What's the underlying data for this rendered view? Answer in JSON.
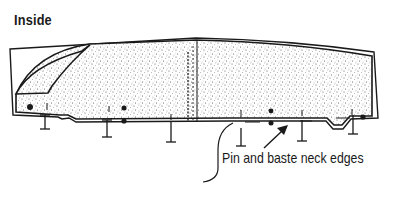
{
  "title": "Inside",
  "callout": {
    "label": "Pin and baste neck edges"
  },
  "diagram": {
    "elements": [
      "outer-outline",
      "textured-fabric-body",
      "collar-section",
      "center-fold-line",
      "pins",
      "dots",
      "grain-arrows",
      "callout-leader-line",
      "callout-arrow"
    ]
  },
  "colors": {
    "ink": "#1a1a1a",
    "fabric_texture": "#9a9a9a",
    "background": "#ffffff"
  }
}
